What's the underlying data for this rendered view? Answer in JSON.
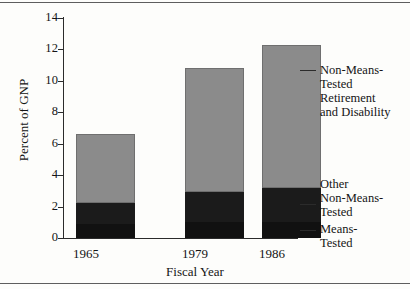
{
  "chart_data": {
    "type": "bar",
    "subtype": "stacked",
    "title": "",
    "xlabel": "Fiscal Year",
    "ylabel": "Percent of GNP",
    "categories": [
      "1965",
      "1979",
      "1986"
    ],
    "ylim": [
      0,
      14
    ],
    "yticks": [
      0,
      2,
      4,
      6,
      8,
      10,
      12,
      14
    ],
    "ytick_labels": [
      "0",
      "2",
      "4",
      "6",
      "8",
      "10",
      "12",
      "14"
    ],
    "grid": false,
    "legend_position": "right-callouts",
    "series": [
      {
        "name": "Means-Tested",
        "color": "#111111",
        "values": [
          0.9,
          1.0,
          1.0
        ]
      },
      {
        "name": "Other Non-Means-Tested",
        "color": "#1b1b1b",
        "values": [
          1.3,
          1.9,
          2.2
        ]
      },
      {
        "name": "Non-Means-Tested Retirement and Disability",
        "color": "#8b8b8b",
        "values": [
          4.4,
          7.9,
          9.1
        ]
      }
    ],
    "totals": [
      6.6,
      10.8,
      12.3
    ],
    "annotations": [
      "Non-Means-Tested Retirement and Disability",
      "Other Non-Means-Tested",
      "Means-Tested"
    ]
  },
  "axes": {
    "y_title": "Percent of GNP",
    "x_title": "Fiscal Year",
    "y_ticks": [
      {
        "label": "14",
        "value": 14
      },
      {
        "label": "12",
        "value": 12
      },
      {
        "label": "10",
        "value": 10
      },
      {
        "label": "8",
        "value": 8
      },
      {
        "label": "6",
        "value": 6
      },
      {
        "label": "4",
        "value": 4
      },
      {
        "label": "2",
        "value": 2
      },
      {
        "label": "0",
        "value": 0
      }
    ],
    "x_ticks": [
      {
        "label": "1965"
      },
      {
        "label": "1979"
      },
      {
        "label": "1986"
      }
    ]
  },
  "legend": {
    "items": [
      {
        "label": "Non-Means-\nTested\nRetirement\nand Disability",
        "color": "#8b8b8b"
      },
      {
        "label": "Other\nNon-Means-\nTested",
        "color": "#1b1b1b"
      },
      {
        "label": "Means-\nTested",
        "color": "#111111"
      }
    ]
  },
  "colors": {
    "non_means_tested_retirement": "#8b8b8b",
    "other_non_means_tested": "#1b1b1b",
    "means_tested": "#111111",
    "axis": "#2b2b2b",
    "background": "#fdfdfb"
  }
}
